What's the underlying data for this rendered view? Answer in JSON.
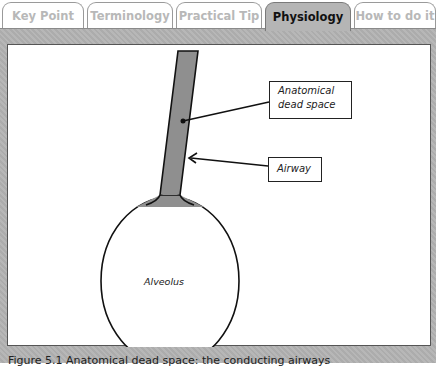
{
  "tabs": [
    {
      "label": "Key Point",
      "active": false
    },
    {
      "label": "Terminology",
      "active": false
    },
    {
      "label": "Practical Tip",
      "active": false
    },
    {
      "label": "Physiology",
      "active": true
    },
    {
      "label": "How to do it",
      "active": false
    }
  ],
  "figure": {
    "labels": {
      "dead_space": "Anatomical dead space",
      "dead_space_line1": "Anatomical",
      "dead_space_line2": "dead space",
      "airway": "Airway",
      "alveolus": "Alveolus"
    },
    "colors": {
      "airway_fill": "#8f8f8f",
      "outline": "#111111",
      "panel_bg": "#b3b3b3"
    },
    "caption": "Figure 5.1 Anatomical dead space: the conducting airways"
  }
}
